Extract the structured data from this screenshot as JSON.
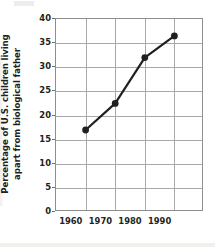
{
  "chart_data": {
    "type": "line",
    "title": "",
    "xlabel": "",
    "ylabel": "Percentage of U.S. children living apart from biological father",
    "ylabel_line1": "Percentage of U.S. children living",
    "ylabel_line2": "apart from biological father",
    "categories": [
      "1960",
      "1970",
      "1980",
      "1990"
    ],
    "x": [
      1960,
      1970,
      1980,
      1990
    ],
    "values": [
      17,
      22.5,
      32,
      36.5
    ],
    "series": [
      {
        "name": "Percentage of U.S. children living apart from biological father",
        "values": [
          17,
          22.5,
          32,
          36.5
        ]
      }
    ],
    "ylim": [
      0,
      40
    ],
    "ytick_labels": [
      "0",
      "5",
      "10",
      "15",
      "20",
      "25",
      "30",
      "35",
      "40"
    ],
    "ytick_values": [
      0,
      5,
      10,
      15,
      20,
      25,
      30,
      35,
      40
    ],
    "xtick_labels": [
      "1960",
      "1970",
      "1980",
      "1990"
    ],
    "grid": true,
    "legend": "none",
    "line_color": "#231f20",
    "marker_color": "#231f20",
    "marker_shape": "circle",
    "grid_color": "#a8a8a8",
    "frame_color": "#8e8e8e",
    "background_color": "#ffffff",
    "text_color": "#231f20"
  }
}
